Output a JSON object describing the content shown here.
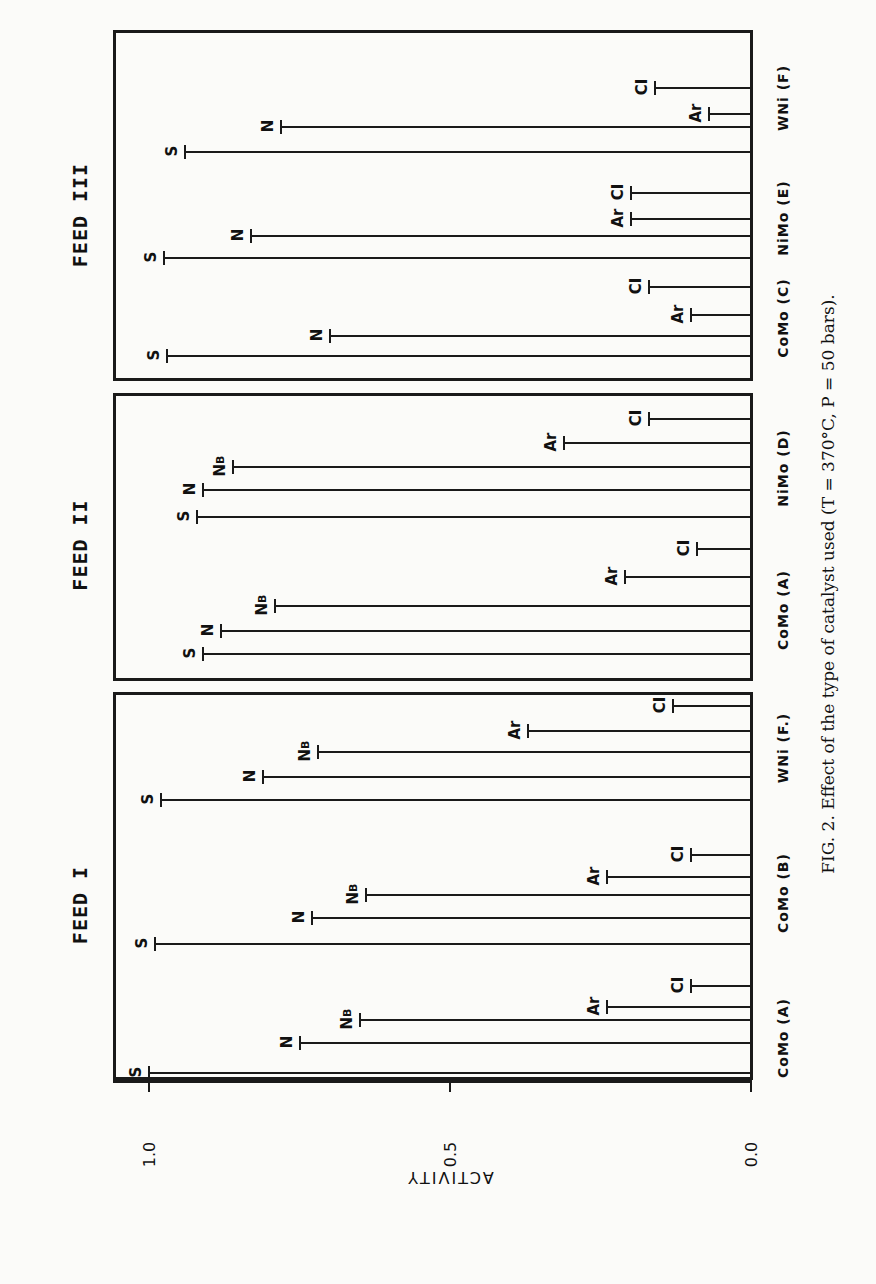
{
  "caption": "FIG. 2.  Effect of the type of catalyst used (T = 370°C, P = 50 bars).",
  "axis": {
    "label": "ACTIVITY",
    "ticks": [
      "0.0",
      "0.5",
      "1.0"
    ]
  },
  "chart_data": {
    "type": "bar",
    "orientation": "rotated-90 (bars horizontal on page, value axis left=1.0 to right=0.0)",
    "title": "Effect of the type of catalyst used (T = 370°C, P = 50 bars)",
    "figure_label": "FIG. 2.",
    "ylabel": "ACTIVITY",
    "ylim": [
      0.0,
      1.0
    ],
    "yticks": [
      0.0,
      0.5,
      1.0
    ],
    "grid": false,
    "panels": [
      {
        "name": "FEED I",
        "groups": [
          {
            "catalyst": "CoMo (A)",
            "bars": [
              {
                "label": "S",
                "value": 1.0
              },
              {
                "label": "N",
                "value": 0.75
              },
              {
                "label": "NB",
                "value": 0.65
              },
              {
                "label": "Ar",
                "value": 0.24
              },
              {
                "label": "CI",
                "value": 0.1
              }
            ]
          },
          {
            "catalyst": "CoMo (B)",
            "bars": [
              {
                "label": "S",
                "value": 0.99
              },
              {
                "label": "N",
                "value": 0.73
              },
              {
                "label": "NB",
                "value": 0.64
              },
              {
                "label": "Ar",
                "value": 0.24
              },
              {
                "label": "CI",
                "value": 0.1
              }
            ]
          },
          {
            "catalyst": "WNi (F.)",
            "bars": [
              {
                "label": "S",
                "value": 0.98
              },
              {
                "label": "N",
                "value": 0.81
              },
              {
                "label": "NB",
                "value": 0.72
              },
              {
                "label": "Ar",
                "value": 0.37
              },
              {
                "label": "CI",
                "value": 0.13
              }
            ]
          }
        ]
      },
      {
        "name": "FEED II",
        "groups": [
          {
            "catalyst": "CoMo (A)",
            "bars": [
              {
                "label": "S",
                "value": 0.91
              },
              {
                "label": "N",
                "value": 0.88
              },
              {
                "label": "NB",
                "value": 0.79
              },
              {
                "label": "Ar",
                "value": 0.21
              },
              {
                "label": "CI",
                "value": 0.09
              }
            ]
          },
          {
            "catalyst": "NiMo (D)",
            "bars": [
              {
                "label": "S",
                "value": 0.92
              },
              {
                "label": "N",
                "value": 0.91
              },
              {
                "label": "NB",
                "value": 0.86
              },
              {
                "label": "Ar",
                "value": 0.31
              },
              {
                "label": "CI",
                "value": 0.17
              }
            ]
          }
        ]
      },
      {
        "name": "FEED III",
        "groups": [
          {
            "catalyst": "CoMo (C)",
            "bars": [
              {
                "label": "S",
                "value": 0.97
              },
              {
                "label": "N",
                "value": 0.7
              },
              {
                "label": "Ar",
                "value": 0.1
              },
              {
                "label": "CI",
                "value": 0.17
              }
            ]
          },
          {
            "catalyst": "NiMo (E)",
            "bars": [
              {
                "label": "S",
                "value": 0.975
              },
              {
                "label": "N",
                "value": 0.83
              },
              {
                "label": "Ar",
                "value": 0.2
              },
              {
                "label": "CI",
                "value": 0.2
              }
            ]
          },
          {
            "catalyst": "WNi (F)",
            "bars": [
              {
                "label": "S",
                "value": 0.94
              },
              {
                "label": "N",
                "value": 0.78
              },
              {
                "label": "Ar",
                "value": 0.07
              },
              {
                "label": "CI",
                "value": 0.16
              }
            ]
          }
        ]
      }
    ]
  },
  "layout": {
    "x_zero": 751,
    "x_one": 149,
    "panels": [
      {
        "top": 692,
        "bottom": 1080,
        "feed_label_y": 905,
        "groups": [
          {
            "bars_y": [
              1073,
              1043,
              1020,
              1007,
              986
            ],
            "cat_y": 1040
          },
          {
            "bars_y": [
              944,
              918,
              895,
              877,
              855
            ],
            "cat_y": 895
          },
          {
            "bars_y": [
              800,
              777,
              752,
              731,
              706
            ],
            "cat_y": 750
          }
        ]
      },
      {
        "top": 393,
        "bottom": 681,
        "feed_label_y": 545,
        "groups": [
          {
            "bars_y": [
              654,
              631,
              606,
              577,
              549
            ],
            "cat_y": 612
          },
          {
            "bars_y": [
              517,
              490,
              467,
              443,
              419
            ],
            "cat_y": 470
          }
        ]
      },
      {
        "top": 30,
        "bottom": 381,
        "feed_label_y": 215,
        "groups": [
          {
            "bars_y": [
              356,
              336,
              315,
              287
            ],
            "cat_y": 320
          },
          {
            "bars_y": [
              258,
              236,
              219,
              193
            ],
            "cat_y": 220
          },
          {
            "bars_y": [
              152,
              127,
              114,
              88
            ],
            "cat_y": 100
          }
        ]
      }
    ]
  }
}
